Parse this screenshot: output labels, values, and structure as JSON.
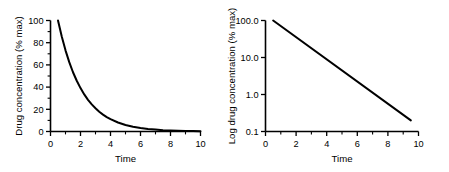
{
  "figure": {
    "background": "#ffffff",
    "ink": "#000000",
    "panel_count": 2
  },
  "chart_data": [
    {
      "id": "linear-panel",
      "type": "line",
      "title": "",
      "subtitle": "",
      "xlabel": "Time",
      "ylabel": "Drug concentration (% max)",
      "xlim": [
        0,
        10
      ],
      "ylim": [
        0,
        100
      ],
      "yscale": "linear",
      "grid": false,
      "legend": "none",
      "xticks": [
        0,
        2,
        4,
        6,
        8,
        10
      ],
      "xticklabels": [
        "0",
        "2",
        "4",
        "6",
        "8",
        "10"
      ],
      "xminorticks": [
        1,
        3,
        5,
        7,
        9
      ],
      "yticks": [
        0,
        20,
        40,
        60,
        80,
        100
      ],
      "yticklabels": [
        "0",
        "20",
        "40",
        "60",
        "80",
        "100"
      ],
      "yminorticks": [
        10,
        30,
        50,
        70,
        90
      ],
      "series": [
        {
          "name": "drug concentration",
          "color": "#000000",
          "linewidth": 2,
          "x": [
            0.5,
            0.75,
            1.0,
            1.25,
            1.5,
            1.75,
            2.0,
            2.25,
            2.5,
            2.75,
            3.0,
            3.25,
            3.5,
            3.75,
            4.0,
            4.5,
            5.0,
            5.5,
            6.0,
            6.5,
            7.0,
            7.5,
            8.0,
            8.5,
            9.0,
            9.5,
            10.0
          ],
          "values": [
            100.0,
            85.5,
            73.1,
            62.5,
            53.4,
            45.7,
            39.1,
            33.4,
            28.5,
            24.4,
            20.9,
            17.8,
            15.2,
            13.0,
            11.1,
            8.1,
            5.9,
            4.3,
            3.2,
            2.3,
            1.7,
            1.2,
            0.9,
            0.7,
            0.5,
            0.4,
            0.3
          ]
        }
      ]
    },
    {
      "id": "log-panel",
      "type": "line",
      "title": "",
      "subtitle": "",
      "xlabel": "Time",
      "ylabel": "Log drug concentration (% max)",
      "xlim": [
        0,
        10
      ],
      "ylim": [
        0.1,
        100
      ],
      "yscale": "log",
      "grid": false,
      "legend": "none",
      "xticks": [
        0,
        2,
        4,
        6,
        8,
        10
      ],
      "xticklabels": [
        "0",
        "2",
        "4",
        "6",
        "8",
        "10"
      ],
      "xminorticks": [
        1,
        3,
        5,
        7,
        9
      ],
      "yticks": [
        0.1,
        1.0,
        10.0,
        100.0
      ],
      "yticklabels": [
        "0.1",
        "1.0",
        "10.0",
        "100.0"
      ],
      "series": [
        {
          "name": "log drug concentration",
          "color": "#000000",
          "linewidth": 2,
          "x": [
            0.5,
            9.5
          ],
          "values": [
            100.0,
            0.2
          ]
        }
      ]
    }
  ]
}
